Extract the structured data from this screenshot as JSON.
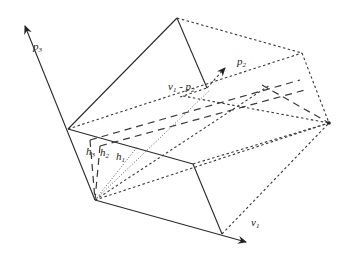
{
  "figure": {
    "labels": {
      "p3": "p",
      "p3_sub": "3",
      "p2": "p",
      "p2_sub": "2",
      "v1p2": "v",
      "v1p2_sub1": "1",
      "v1p2_mid": " - p",
      "v1p2_sub2": "2",
      "h3": "h",
      "h3_sub": "3",
      "h2": "h",
      "h2_sub": "2",
      "h1": "h",
      "h1_sub": "1",
      "v1": "v",
      "v1_sub": "1"
    },
    "colors": {
      "line": "#2a2a2a",
      "background": "#ffffff"
    }
  }
}
